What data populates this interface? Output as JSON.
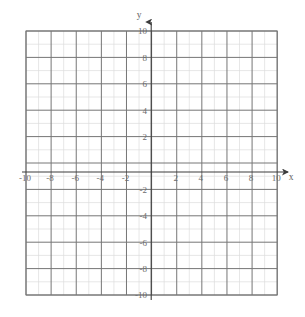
{
  "figure": {
    "kind": "cartesian-coordinate-grid",
    "background_color": "#ffffff"
  },
  "axis_names": {
    "x": "x",
    "y": "y"
  },
  "colors": {
    "minor_gridline": "#dcdcdc",
    "major_gridline": "#767676",
    "axis_line": "#3c3c3c",
    "tick_label": "#6b6b6b",
    "axis_name": "#5f5f5f",
    "background": "#ffffff"
  },
  "chart_data": {
    "type": "scatter",
    "title": "",
    "subtitle": "",
    "xlabel": "x",
    "ylabel": "y",
    "xlim": [
      -10,
      10
    ],
    "ylim": [
      -10,
      10
    ],
    "grid": true,
    "minor_tick_step": 1,
    "major_tick_step": 2,
    "legend": null,
    "series": [],
    "x_tick_labels": [
      "-10",
      "-8",
      "-6",
      "-4",
      "-2",
      "2",
      "4",
      "6",
      "8",
      "10"
    ],
    "x_tick_values": [
      -10,
      -8,
      -6,
      -4,
      -2,
      2,
      4,
      6,
      8,
      10
    ],
    "y_tick_labels": [
      "10",
      "8",
      "6",
      "4",
      "2",
      "-2",
      "-4",
      "-6",
      "-8",
      "-10"
    ],
    "y_tick_values": [
      10,
      8,
      6,
      4,
      2,
      -2,
      -4,
      -6,
      -8,
      -10
    ],
    "origin_label_shown": false,
    "annotations": []
  },
  "x_ticks": [
    {
      "value": -10,
      "label": "-10"
    },
    {
      "value": -8,
      "label": "-8"
    },
    {
      "value": -6,
      "label": "-6"
    },
    {
      "value": -4,
      "label": "-4"
    },
    {
      "value": -2,
      "label": "-2"
    },
    {
      "value": 2,
      "label": "2"
    },
    {
      "value": 4,
      "label": "4"
    },
    {
      "value": 6,
      "label": "6"
    },
    {
      "value": 8,
      "label": "8"
    },
    {
      "value": 10,
      "label": "10"
    }
  ],
  "y_ticks": [
    {
      "value": 10,
      "label": "10"
    },
    {
      "value": 8,
      "label": "8"
    },
    {
      "value": 6,
      "label": "6"
    },
    {
      "value": 4,
      "label": "4"
    },
    {
      "value": 2,
      "label": "2"
    },
    {
      "value": -2,
      "label": "-2"
    },
    {
      "value": -4,
      "label": "-4"
    },
    {
      "value": -6,
      "label": "-6"
    },
    {
      "value": -8,
      "label": "-8"
    },
    {
      "value": -10,
      "label": "-10"
    }
  ]
}
